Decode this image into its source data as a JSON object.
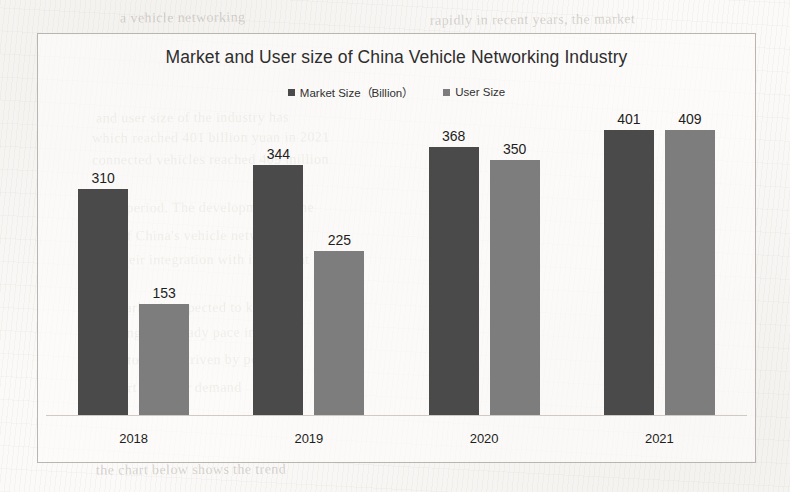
{
  "page": {
    "background_color": "#fbfaf8",
    "frame_border_color": "#b9b5b0"
  },
  "bleed_through_text": [
    {
      "text": "a vehicle networking",
      "x": 120,
      "y": 10,
      "rotate": -0.5
    },
    {
      "text": "rapidly in recent years, the market",
      "x": 430,
      "y": 12,
      "rotate": -0.4
    },
    {
      "text": "and user size of the industry has",
      "x": 96,
      "y": 110,
      "rotate": -0.3
    },
    {
      "text": "which reached 401 billion yuan in 2021",
      "x": 92,
      "y": 130,
      "rotate": -0.3
    },
    {
      "text": "connected vehicles reached 409 million",
      "x": 92,
      "y": 152,
      "rotate": -0.2
    },
    {
      "text": "same period. The development of the",
      "x": 92,
      "y": 200,
      "rotate": -0.2
    },
    {
      "text": "tion of China's vehicle networking",
      "x": 92,
      "y": 228,
      "rotate": -0.2
    },
    {
      "text": "and their integration with intelligent",
      "x": 92,
      "y": 252,
      "rotate": -0.2
    },
    {
      "text": "the market is expected to keep",
      "x": 92,
      "y": 300,
      "rotate": -0.2
    },
    {
      "text": "growing at a steady pace in the",
      "x": 92,
      "y": 325,
      "rotate": -0.2
    },
    {
      "text": "years to come, driven by policy",
      "x": 92,
      "y": 352,
      "rotate": -0.2
    },
    {
      "text": "support and user demand",
      "x": 92,
      "y": 380,
      "rotate": -0.2
    },
    {
      "text": "the chart below shows the trend",
      "x": 96,
      "y": 462,
      "rotate": -0.3
    }
  ],
  "chart_data": {
    "type": "bar",
    "title": "Market and User size of China Vehicle Networking Industry",
    "xlabel": "",
    "ylabel": "",
    "categories": [
      "2018",
      "2019",
      "2020",
      "2021"
    ],
    "series": [
      {
        "name": "Market Size（Billion）",
        "color": "#4a4a4a",
        "values": [
          310,
          344,
          368,
          401
        ]
      },
      {
        "name": "User Size",
        "color": "#7d7d7d",
        "values": [
          153,
          225,
          350,
          409
        ]
      }
    ],
    "ylim": [
      0,
      430
    ],
    "grid": false,
    "axis_line_color": "#cfcac4",
    "legend_position": "top-center",
    "data_labels_shown": true
  }
}
